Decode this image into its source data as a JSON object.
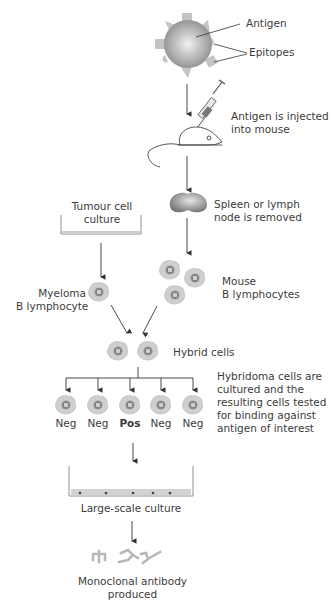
{
  "labels": {
    "antigen": "Antigen",
    "epitopes": "Epitopes",
    "injected": [
      "Antigen is injected",
      "into mouse"
    ],
    "spleen": [
      "Spleen or lymph",
      "node is removed"
    ],
    "tumour": [
      "Tumour cell",
      "culture"
    ],
    "myeloma": [
      "Myeloma",
      "B lymphocyte"
    ],
    "mouse_b": [
      "Mouse",
      "B lymphocytes"
    ],
    "hybrid": "Hybrid cells",
    "hybridoma": [
      "Hybridoma cells are",
      "cultured and the",
      "resulting cells tested",
      "for binding against",
      "antigen of interest"
    ],
    "results": [
      "Neg",
      "Neg",
      "Pos",
      "Neg",
      "Neg"
    ],
    "large_scale": "Large-scale culture",
    "product": [
      "Monoclonal antibody",
      "produced"
    ]
  },
  "colors": {
    "arrow": "#3a3a3a",
    "cell_fill": "#c8c8c8",
    "nucleus": "#8a8a8a",
    "sphere": "#a8a8a8"
  },
  "icons": [
    "antigen-sphere",
    "syringe",
    "mouse",
    "spleen",
    "culture-dish",
    "cell",
    "antibody"
  ]
}
